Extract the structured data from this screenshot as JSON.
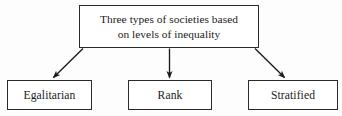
{
  "diagram": {
    "type": "flowchart-tree",
    "orientation": "top-down",
    "background_color": "#fdfdfd",
    "border_color": "#2b2b2b",
    "text_color": "#1a1a1a",
    "root": {
      "id": "three-types-of-societies",
      "line1": "Three types of societies based",
      "line2": "on levels of inequality"
    },
    "branches": [
      {
        "id": "egalitarian",
        "label": "Egalitarian",
        "arrow": "diagonal-down-left"
      },
      {
        "id": "rank",
        "label": "Rank",
        "arrow": "vertical-down"
      },
      {
        "id": "stratified",
        "label": "Stratified",
        "arrow": "diagonal-down-right"
      }
    ]
  }
}
